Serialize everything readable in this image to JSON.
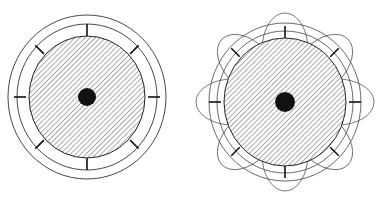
{
  "figure": {
    "title": "",
    "caption": "",
    "background_color": "#ffffff",
    "stroke_color": "#222222",
    "hub_color": "#111111",
    "hatch_color": "#555555",
    "panels": [
      {
        "id": "left-panel",
        "name": "plain-radial-diagram",
        "label": "",
        "center": {
          "x": 87,
          "y": 97
        },
        "rings": [
          {
            "name": "outer-ring",
            "rx": 79,
            "ry": 82,
            "stroke": "#333333",
            "width": 0.9
          },
          {
            "name": "inner-ring",
            "rx": 70,
            "ry": 73,
            "stroke": "#333333",
            "width": 0.9
          }
        ],
        "disc": {
          "name": "hatched-disc",
          "rx": 58,
          "ry": 61,
          "fill": "hatch-45",
          "stroke": "#222222",
          "width": 1.0
        },
        "hub": {
          "name": "center-hub",
          "r": 9,
          "fill": "#111111"
        },
        "spokes": {
          "count": 8,
          "start_radius": 61,
          "end_radius": 73,
          "start_angle_deg": -90,
          "width": 1.6,
          "color": "#111111"
        }
      },
      {
        "id": "right-panel",
        "name": "petal-radial-diagram",
        "label": "",
        "center": {
          "x": 285,
          "y": 102
        },
        "rings": [
          {
            "name": "outer-ring",
            "rx": 76,
            "ry": 79,
            "stroke": "#444444",
            "width": 0.8
          },
          {
            "name": "inner-ring",
            "rx": 68,
            "ry": 71,
            "stroke": "#444444",
            "width": 0.8
          }
        ],
        "disc": {
          "name": "hatched-disc",
          "rx": 61,
          "ry": 64,
          "fill": "hatch-45",
          "stroke": "#222222",
          "width": 1.0
        },
        "hub": {
          "name": "center-hub",
          "r": 10,
          "fill": "#111111"
        },
        "spokes": {
          "count": 8,
          "start_radius": 64,
          "end_radius": 76,
          "start_angle_deg": -90,
          "width": 1.6,
          "color": "#111111"
        },
        "petals": {
          "count": 8,
          "start_angle_deg": -90,
          "inner_radius": 16,
          "outer_radius": 89,
          "half_width": 23,
          "stroke": "#555555",
          "width": 0.8
        }
      }
    ],
    "hatch_pattern": {
      "name": "hatch-45",
      "angle_deg": 45,
      "spacing": 2.6,
      "line_width": 0.75,
      "color": "#4a4a4a"
    }
  }
}
